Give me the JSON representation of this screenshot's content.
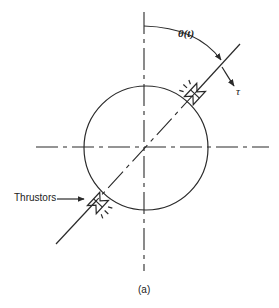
{
  "figure": {
    "caption": "(a)",
    "labels": {
      "angle": "θ(t)",
      "torque": "τ",
      "thrustors": "Thrustors"
    },
    "geometry": {
      "circle": {
        "cx": 146,
        "cy": 147,
        "r": 62
      },
      "vertical_axis": {
        "x": 144,
        "y1": 12,
        "y2": 271
      },
      "horizontal_axis": {
        "y": 147,
        "x1": 36,
        "x2": 269
      },
      "rotated_axis": {
        "x1": 56,
        "y1": 244,
        "x2": 240,
        "y2": 44
      }
    }
  }
}
